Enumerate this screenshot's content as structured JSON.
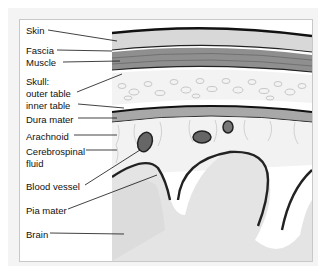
{
  "labels": [
    {
      "id": "skin",
      "text": "Skin",
      "x": 26,
      "y": 25
    },
    {
      "id": "fascia",
      "text": "Fascia",
      "x": 26,
      "y": 45
    },
    {
      "id": "muscle",
      "text": "Muscle",
      "x": 26,
      "y": 57
    },
    {
      "id": "skull",
      "text": "Skull:",
      "x": 26,
      "y": 76
    },
    {
      "id": "outer-table",
      "text": "outer table",
      "x": 26,
      "y": 88
    },
    {
      "id": "inner-table",
      "text": "inner table",
      "x": 26,
      "y": 100
    },
    {
      "id": "dura-mater",
      "text": "Dura mater",
      "x": 26,
      "y": 114
    },
    {
      "id": "arachnoid",
      "text": "Arachnoid",
      "x": 26,
      "y": 131
    },
    {
      "id": "csf-1",
      "text": "Cerebrospinal",
      "x": 26,
      "y": 147
    },
    {
      "id": "csf-2",
      "text": "fluid",
      "x": 26,
      "y": 159
    },
    {
      "id": "blood-vessel",
      "text": "Blood vessel",
      "x": 26,
      "y": 181
    },
    {
      "id": "pia-mater",
      "text": "Pia mater",
      "x": 26,
      "y": 205
    },
    {
      "id": "brain",
      "text": "Brain",
      "x": 26,
      "y": 229
    }
  ],
  "colors": {
    "frame_bg": "#f4f4f4",
    "border": "#c8c8c8",
    "skin": "#d6d6d6",
    "muscle": "#9a9a9a",
    "bone": "#e8e8e8",
    "dura": "#aaaaaa",
    "brain": "#e6e6e6"
  }
}
